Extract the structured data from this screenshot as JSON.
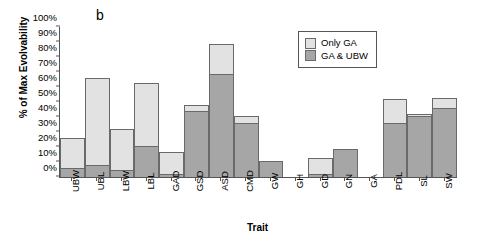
{
  "panel": {
    "letter": "b"
  },
  "legend": {
    "position": "top-right-inside",
    "items": [
      {
        "label": "Only GA",
        "swatch": "light",
        "color": "#e2e2e2"
      },
      {
        "label": "GA & UBW",
        "swatch": "dark",
        "color": "#a6a6a6"
      }
    ]
  },
  "chart_data": {
    "type": "bar",
    "stacked": true,
    "title": "",
    "xlabel": "Trait",
    "ylabel": "% of Max Evolvability",
    "ylim": [
      0,
      100
    ],
    "ytick_labels": [
      "0%",
      "10%",
      "20%",
      "30%",
      "40%",
      "50%",
      "60%",
      "70%",
      "80%",
      "90%",
      "100%"
    ],
    "ytick_values": [
      0,
      10,
      20,
      30,
      40,
      50,
      60,
      70,
      80,
      90,
      100
    ],
    "grid": false,
    "categories": [
      "UBW",
      "UBL",
      "LBW",
      "LBL",
      "GAD",
      "GSD",
      "ASD",
      "CMD",
      "GW",
      "GH",
      "GD",
      "GN",
      "GA",
      "PDL",
      "SL",
      "SW"
    ],
    "series": [
      {
        "name": "GA & UBW",
        "color": "#a6a6a6",
        "values": [
          6,
          8,
          5,
          21,
          2,
          44,
          69,
          36,
          11,
          0,
          2,
          19,
          0,
          36,
          41,
          46
        ]
      },
      {
        "name": "Only GA",
        "color": "#e2e2e2",
        "values": [
          20,
          58,
          27,
          42,
          15,
          4,
          20,
          5,
          0,
          0,
          11,
          0,
          0,
          16,
          1,
          7
        ]
      }
    ],
    "totals": [
      26,
      66,
      32,
      63,
      17,
      48,
      89,
      41,
      11,
      0,
      13,
      19,
      0,
      52,
      42,
      53
    ]
  }
}
